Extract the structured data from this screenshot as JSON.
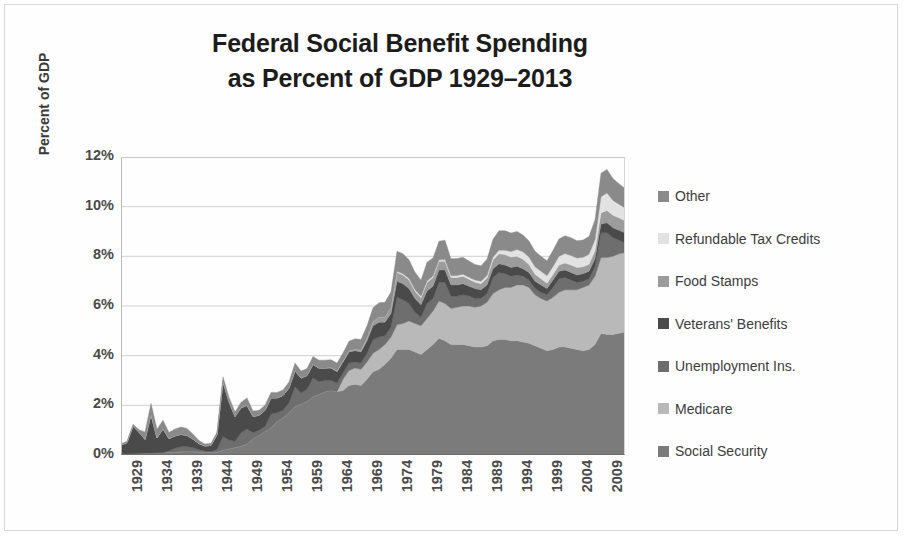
{
  "chart_data": {
    "type": "area",
    "stacked": true,
    "title": "Federal Social Benefit Spending as Percent of GDP 1929–2013",
    "title_lines": [
      "Federal Social Benefit Spending",
      "as Percent of GDP 1929–2013"
    ],
    "xlabel": "",
    "ylabel": "Percent of GDP",
    "ylim": [
      0,
      12
    ],
    "xlim": [
      1929,
      2013
    ],
    "ytick_labels": [
      "12%",
      "10%",
      "8%",
      "6%",
      "4%",
      "2%",
      "0%"
    ],
    "ytick_values": [
      12,
      10,
      8,
      6,
      4,
      2,
      0
    ],
    "ytick_suffix": "%",
    "xtick_labels": [
      "1929",
      "1934",
      "1939",
      "1944",
      "1949",
      "1954",
      "1959",
      "1964",
      "1969",
      "1974",
      "1979",
      "1984",
      "1989",
      "1994",
      "1999",
      "2004",
      "2009"
    ],
    "xtick_values": [
      1929,
      1934,
      1939,
      1944,
      1949,
      1954,
      1959,
      1964,
      1969,
      1974,
      1979,
      1984,
      1989,
      1994,
      1999,
      2004,
      2009
    ],
    "grid": true,
    "grid_axis": "y",
    "legend_position": "right",
    "x": [
      1929,
      1930,
      1931,
      1932,
      1933,
      1934,
      1935,
      1936,
      1937,
      1938,
      1939,
      1940,
      1941,
      1942,
      1943,
      1944,
      1945,
      1946,
      1947,
      1948,
      1949,
      1950,
      1951,
      1952,
      1953,
      1954,
      1955,
      1956,
      1957,
      1958,
      1959,
      1960,
      1961,
      1962,
      1963,
      1964,
      1965,
      1966,
      1967,
      1968,
      1969,
      1970,
      1971,
      1972,
      1973,
      1974,
      1975,
      1976,
      1977,
      1978,
      1979,
      1980,
      1981,
      1982,
      1983,
      1984,
      1985,
      1986,
      1987,
      1988,
      1989,
      1990,
      1991,
      1992,
      1993,
      1994,
      1995,
      1996,
      1997,
      1998,
      1999,
      2000,
      2001,
      2002,
      2003,
      2004,
      2005,
      2006,
      2007,
      2008,
      2009,
      2010,
      2011,
      2012,
      2013
    ],
    "series": [
      {
        "name": "Social Security",
        "color": "#7b7b7b",
        "values": [
          0.05,
          0.05,
          0.06,
          0.07,
          0.08,
          0.08,
          0.09,
          0.1,
          0.11,
          0.12,
          0.13,
          0.14,
          0.14,
          0.13,
          0.12,
          0.11,
          0.12,
          0.2,
          0.25,
          0.3,
          0.35,
          0.45,
          0.65,
          0.8,
          0.95,
          1.1,
          1.35,
          1.5,
          1.7,
          1.95,
          2.05,
          2.15,
          2.35,
          2.45,
          2.55,
          2.6,
          2.55,
          2.6,
          2.8,
          2.85,
          2.8,
          3.05,
          3.35,
          3.45,
          3.65,
          3.9,
          4.25,
          4.25,
          4.25,
          4.15,
          4.05,
          4.25,
          4.45,
          4.7,
          4.6,
          4.45,
          4.45,
          4.45,
          4.4,
          4.35,
          4.35,
          4.4,
          4.6,
          4.65,
          4.65,
          4.6,
          4.6,
          4.55,
          4.5,
          4.4,
          4.3,
          4.2,
          4.25,
          4.35,
          4.35,
          4.3,
          4.25,
          4.2,
          4.25,
          4.45,
          4.9,
          4.85,
          4.85,
          4.9,
          4.95
        ]
      },
      {
        "name": "Medicare",
        "color": "#b9b9b9",
        "values": [
          0,
          0,
          0,
          0,
          0,
          0,
          0,
          0,
          0,
          0,
          0,
          0,
          0,
          0,
          0,
          0,
          0,
          0,
          0,
          0,
          0,
          0,
          0,
          0,
          0,
          0,
          0,
          0,
          0,
          0,
          0,
          0,
          0,
          0,
          0,
          0,
          0,
          0.45,
          0.6,
          0.65,
          0.65,
          0.7,
          0.75,
          0.8,
          0.8,
          0.85,
          1.0,
          1.05,
          1.15,
          1.15,
          1.15,
          1.25,
          1.35,
          1.5,
          1.5,
          1.45,
          1.5,
          1.55,
          1.6,
          1.6,
          1.65,
          1.75,
          1.9,
          2.0,
          2.1,
          2.15,
          2.25,
          2.3,
          2.25,
          2.05,
          2.0,
          2.0,
          2.1,
          2.2,
          2.3,
          2.35,
          2.4,
          2.55,
          2.6,
          2.75,
          3.05,
          3.1,
          3.15,
          3.2,
          3.2
        ]
      },
      {
        "name": "Unemployment Ins.",
        "color": "#6e6e6e",
        "values": [
          0,
          0,
          0,
          0,
          0,
          0,
          0,
          0,
          0.05,
          0.15,
          0.2,
          0.2,
          0.15,
          0.08,
          0.04,
          0.03,
          0.1,
          0.55,
          0.35,
          0.25,
          0.55,
          0.6,
          0.25,
          0.2,
          0.2,
          0.55,
          0.35,
          0.3,
          0.4,
          0.8,
          0.45,
          0.5,
          0.75,
          0.5,
          0.45,
          0.4,
          0.35,
          0.25,
          0.3,
          0.25,
          0.25,
          0.35,
          0.55,
          0.5,
          0.35,
          0.4,
          1.1,
          0.95,
          0.7,
          0.45,
          0.35,
          0.6,
          0.5,
          0.75,
          0.85,
          0.5,
          0.45,
          0.45,
          0.4,
          0.35,
          0.3,
          0.35,
          0.65,
          0.7,
          0.55,
          0.45,
          0.4,
          0.35,
          0.3,
          0.25,
          0.25,
          0.25,
          0.4,
          0.55,
          0.5,
          0.4,
          0.3,
          0.25,
          0.25,
          0.4,
          1.0,
          1.0,
          0.75,
          0.55,
          0.4
        ]
      },
      {
        "name": "Veterans' Benefits",
        "color": "#4a4a4a",
        "values": [
          0.35,
          0.45,
          1.1,
          0.85,
          0.55,
          1.55,
          0.6,
          0.95,
          0.5,
          0.5,
          0.5,
          0.45,
          0.35,
          0.25,
          0.2,
          0.25,
          0.6,
          2.2,
          1.55,
          1.0,
          1.0,
          0.95,
          0.65,
          0.6,
          0.65,
          0.65,
          0.6,
          0.6,
          0.6,
          0.65,
          0.6,
          0.55,
          0.55,
          0.55,
          0.5,
          0.5,
          0.45,
          0.45,
          0.45,
          0.45,
          0.45,
          0.5,
          0.55,
          0.6,
          0.55,
          0.55,
          0.65,
          0.65,
          0.6,
          0.55,
          0.5,
          0.5,
          0.5,
          0.5,
          0.5,
          0.45,
          0.45,
          0.45,
          0.4,
          0.4,
          0.35,
          0.35,
          0.35,
          0.35,
          0.35,
          0.35,
          0.35,
          0.3,
          0.3,
          0.3,
          0.3,
          0.25,
          0.3,
          0.3,
          0.3,
          0.3,
          0.3,
          0.3,
          0.3,
          0.3,
          0.35,
          0.4,
          0.4,
          0.4,
          0.4
        ]
      },
      {
        "name": "Food Stamps",
        "color": "#9c9c9c",
        "values": [
          0,
          0,
          0,
          0,
          0,
          0,
          0,
          0,
          0,
          0,
          0,
          0,
          0,
          0,
          0,
          0,
          0,
          0,
          0,
          0,
          0,
          0,
          0,
          0,
          0,
          0,
          0,
          0,
          0,
          0,
          0,
          0,
          0,
          0,
          0,
          0.02,
          0.03,
          0.04,
          0.05,
          0.06,
          0.08,
          0.12,
          0.18,
          0.2,
          0.22,
          0.25,
          0.35,
          0.35,
          0.35,
          0.3,
          0.28,
          0.35,
          0.35,
          0.35,
          0.35,
          0.3,
          0.3,
          0.3,
          0.28,
          0.26,
          0.25,
          0.28,
          0.35,
          0.4,
          0.42,
          0.42,
          0.4,
          0.38,
          0.32,
          0.28,
          0.25,
          0.22,
          0.22,
          0.25,
          0.28,
          0.3,
          0.3,
          0.28,
          0.28,
          0.32,
          0.45,
          0.5,
          0.5,
          0.5,
          0.48
        ]
      },
      {
        "name": "Refundable Tax Credits",
        "color": "#e2e2e2",
        "values": [
          0,
          0,
          0,
          0,
          0,
          0,
          0,
          0,
          0,
          0,
          0,
          0,
          0,
          0,
          0,
          0,
          0,
          0,
          0,
          0,
          0,
          0,
          0,
          0,
          0,
          0,
          0,
          0,
          0,
          0,
          0,
          0,
          0,
          0,
          0,
          0,
          0,
          0,
          0,
          0,
          0,
          0,
          0,
          0,
          0,
          0,
          0.05,
          0.05,
          0.06,
          0.06,
          0.06,
          0.06,
          0.06,
          0.06,
          0.07,
          0.07,
          0.08,
          0.08,
          0.08,
          0.09,
          0.1,
          0.1,
          0.12,
          0.15,
          0.18,
          0.22,
          0.28,
          0.3,
          0.3,
          0.3,
          0.3,
          0.3,
          0.32,
          0.35,
          0.38,
          0.38,
          0.38,
          0.38,
          0.4,
          0.45,
          0.65,
          0.7,
          0.6,
          0.55,
          0.52
        ]
      },
      {
        "name": "Other",
        "color": "#8a8a8a",
        "values": [
          0.05,
          0.05,
          0.08,
          0.1,
          0.3,
          0.45,
          0.35,
          0.35,
          0.25,
          0.28,
          0.3,
          0.28,
          0.2,
          0.12,
          0.08,
          0.08,
          0.1,
          0.2,
          0.18,
          0.18,
          0.22,
          0.3,
          0.22,
          0.2,
          0.2,
          0.22,
          0.22,
          0.22,
          0.24,
          0.3,
          0.28,
          0.28,
          0.32,
          0.32,
          0.32,
          0.32,
          0.32,
          0.32,
          0.38,
          0.42,
          0.42,
          0.48,
          0.55,
          0.58,
          0.58,
          0.62,
          0.8,
          0.8,
          0.75,
          0.7,
          0.65,
          0.75,
          0.72,
          0.75,
          0.78,
          0.68,
          0.68,
          0.68,
          0.65,
          0.62,
          0.62,
          0.65,
          0.72,
          0.78,
          0.78,
          0.75,
          0.72,
          0.68,
          0.65,
          0.62,
          0.6,
          0.6,
          0.65,
          0.7,
          0.72,
          0.72,
          0.7,
          0.7,
          0.72,
          0.8,
          0.95,
          0.95,
          0.88,
          0.82,
          0.78
        ]
      }
    ],
    "legend_order": [
      "Other",
      "Refundable Tax Credits",
      "Food Stamps",
      "Veterans' Benefits",
      "Unemployment Ins.",
      "Medicare",
      "Social Security"
    ]
  },
  "legend": {
    "items": [
      {
        "label": "Other",
        "color": "#8a8a8a"
      },
      {
        "label": "Refundable Tax Credits",
        "color": "#e2e2e2"
      },
      {
        "label": "Food Stamps",
        "color": "#9c9c9c"
      },
      {
        "label": "Veterans' Benefits",
        "color": "#4a4a4a"
      },
      {
        "label": "Unemployment Ins.",
        "color": "#6e6e6e"
      },
      {
        "label": "Medicare",
        "color": "#b9b9b9"
      },
      {
        "label": "Social Security",
        "color": "#7b7b7b"
      }
    ]
  },
  "style": {
    "grid_color": "#d0d0d0",
    "axis_color": "#6d6d6d",
    "text_color": "#4a4a4a",
    "title_color": "#1c1c1c",
    "background": "#ffffff"
  }
}
